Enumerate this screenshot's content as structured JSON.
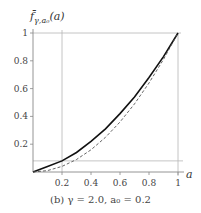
{
  "chart_data": {
    "type": "line",
    "title": "",
    "caption": "(b) γ = 2.0, a₀ = 0.2",
    "xlabel": "a",
    "ylabel": "f̄γ,a₀(a)",
    "xlim": [
      0,
      1
    ],
    "ylim": [
      0,
      1
    ],
    "x_ticks": [
      "0.2",
      "0.4",
      "0.6",
      "0.8",
      "1"
    ],
    "y_ticks": [
      "0.2",
      "0.4",
      "0.6",
      "0.8",
      "1"
    ],
    "grid": false,
    "reference_lines": {
      "vertical_x": 0.2,
      "horizontal_y": 0.08,
      "top_y": 1.0,
      "right_x": 1.0
    },
    "series": [
      {
        "name": "solid",
        "style": "solid",
        "x": [
          0,
          0.1,
          0.2,
          0.3,
          0.4,
          0.5,
          0.6,
          0.7,
          0.8,
          0.9,
          1.0
        ],
        "values": [
          0,
          0.04,
          0.08,
          0.14,
          0.22,
          0.31,
          0.42,
          0.54,
          0.68,
          0.83,
          1.0
        ]
      },
      {
        "name": "dashed",
        "style": "dashed",
        "x": [
          0,
          0.1,
          0.2,
          0.3,
          0.4,
          0.5,
          0.6,
          0.7,
          0.8,
          0.9,
          1.0
        ],
        "values": [
          0,
          0.01,
          0.04,
          0.09,
          0.16,
          0.25,
          0.36,
          0.49,
          0.64,
          0.81,
          1.0
        ]
      }
    ]
  },
  "labels": {
    "ylabel_main": "f̄",
    "ylabel_sub": "γ,a₀",
    "ylabel_arg": "(a)",
    "xlabel": "a",
    "caption": "(b) γ = 2.0, a₀ = 0.2"
  }
}
